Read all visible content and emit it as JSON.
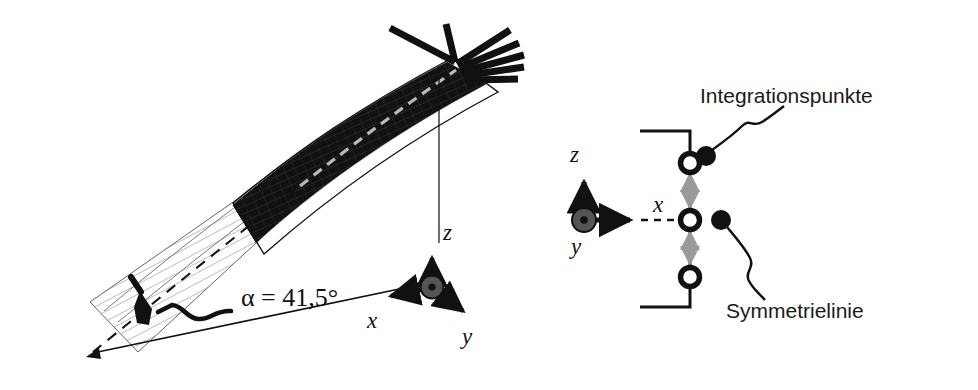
{
  "figure": {
    "kind": "technical-diagram",
    "background": "#ffffff",
    "ink": "#111111",
    "gray_arrow_color": "#9a9a9a",
    "mesh_line_color": "#555555",
    "dark_fill": "#111111"
  },
  "left_panel": {
    "name": "shell-model",
    "angle_label": "α = 41,5°",
    "axes": {
      "z": "z",
      "x": "x",
      "y": "y",
      "origin_marker": "out-of-plane-axis-circle"
    },
    "features": {
      "dark_region": "clamped-shell-segment",
      "light_region": "meshed-shell-segment",
      "centerline": "dashed-symmetry-centerline",
      "supports": "boundary-condition-hatching",
      "drop_line": "apex-to-origin-reference-line",
      "angle_leader": "angle-leader-line"
    }
  },
  "right_panel": {
    "name": "cross-section-detail",
    "labels": {
      "integration_points": "Integrationspunkte",
      "symmetry_line": "Symmetrielinie"
    },
    "axes": {
      "z": "z",
      "x": "x",
      "y": "y"
    },
    "integration_point_count": 3,
    "features": {
      "section_bracket": "section-outline-bracket",
      "thickness_arrows": "gray-thickness-double-arrows",
      "x_axis_dashed": "dashed-x-axis-extension"
    }
  }
}
